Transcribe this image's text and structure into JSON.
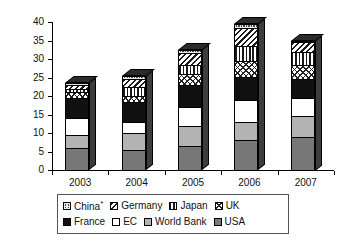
{
  "chart_data": {
    "type": "bar",
    "stacked": true,
    "title": "",
    "subtitle": "",
    "xlabel": "",
    "ylabel": "$ billion",
    "categories": [
      "2003",
      "2004",
      "2005",
      "2006",
      "2007"
    ],
    "ylim": [
      0,
      40
    ],
    "yticks": [
      0,
      5,
      10,
      15,
      20,
      25,
      30,
      35,
      40
    ],
    "ytick_labels": [
      "0",
      "5",
      "10",
      "15",
      "20",
      "25",
      "30",
      "35",
      "40"
    ],
    "grid": false,
    "legend_position": "bottom",
    "stack_order_bottom_to_top": [
      "USA",
      "World Bank",
      "EC",
      "France",
      "UK",
      "Japan",
      "Germany",
      "China*"
    ],
    "series": [
      {
        "name": "USA",
        "key": "usa",
        "pattern": "solid-mid-grey",
        "values": [
          6.0,
          5.5,
          6.5,
          8.0,
          9.0
        ]
      },
      {
        "name": "World Bank",
        "key": "worldbank",
        "pattern": "solid-light-grey",
        "values": [
          3.5,
          4.5,
          5.5,
          5.0,
          5.5
        ]
      },
      {
        "name": "EC",
        "key": "ec",
        "pattern": "white",
        "values": [
          4.5,
          3.0,
          5.0,
          6.0,
          5.0
        ]
      },
      {
        "name": "France",
        "key": "france",
        "pattern": "solid-black",
        "values": [
          5.5,
          5.5,
          6.0,
          6.0,
          5.0
        ]
      },
      {
        "name": "UK",
        "key": "uk",
        "pattern": "cross-hatch-light",
        "values": [
          1.5,
          1.5,
          3.0,
          4.5,
          4.0
        ]
      },
      {
        "name": "Japan",
        "key": "japan",
        "pattern": "vertical-stripes",
        "values": [
          1.0,
          2.5,
          2.5,
          4.0,
          3.5
        ]
      },
      {
        "name": "Germany",
        "key": "germany",
        "pattern": "diagonal-stripes",
        "values": [
          1.0,
          2.0,
          3.0,
          5.0,
          2.5
        ]
      },
      {
        "name": "China*",
        "key": "china",
        "pattern": "dark-fine-grid",
        "values": [
          0.5,
          1.0,
          1.0,
          1.0,
          0.5
        ]
      }
    ],
    "totals": [
      23.5,
      25.5,
      32.5,
      39.5,
      35.0
    ]
  },
  "legend": {
    "rows": [
      [
        {
          "label": "China",
          "superscript": "*",
          "key": "china"
        },
        {
          "label": "Germany",
          "superscript": "",
          "key": "germany"
        },
        {
          "label": "Japan",
          "superscript": "",
          "key": "japan"
        },
        {
          "label": "UK",
          "superscript": "",
          "key": "uk"
        }
      ],
      [
        {
          "label": "France",
          "superscript": "",
          "key": "france"
        },
        {
          "label": "EC",
          "superscript": "",
          "key": "ec"
        },
        {
          "label": "World Bank",
          "superscript": "",
          "key": "worldbank"
        },
        {
          "label": "USA",
          "superscript": "",
          "key": "usa"
        }
      ]
    ]
  },
  "colors": {
    "axis": "#000000",
    "text": "#111111",
    "usa": "#777777",
    "worldbank": "#b3b3b3",
    "ec": "#ffffff",
    "france": "#111111",
    "uk": "#ffffff",
    "japan": "#ffffff",
    "germany": "#ffffff",
    "china": "#4a4a4a",
    "background": "#ffffff",
    "legend_border": "#555555"
  }
}
